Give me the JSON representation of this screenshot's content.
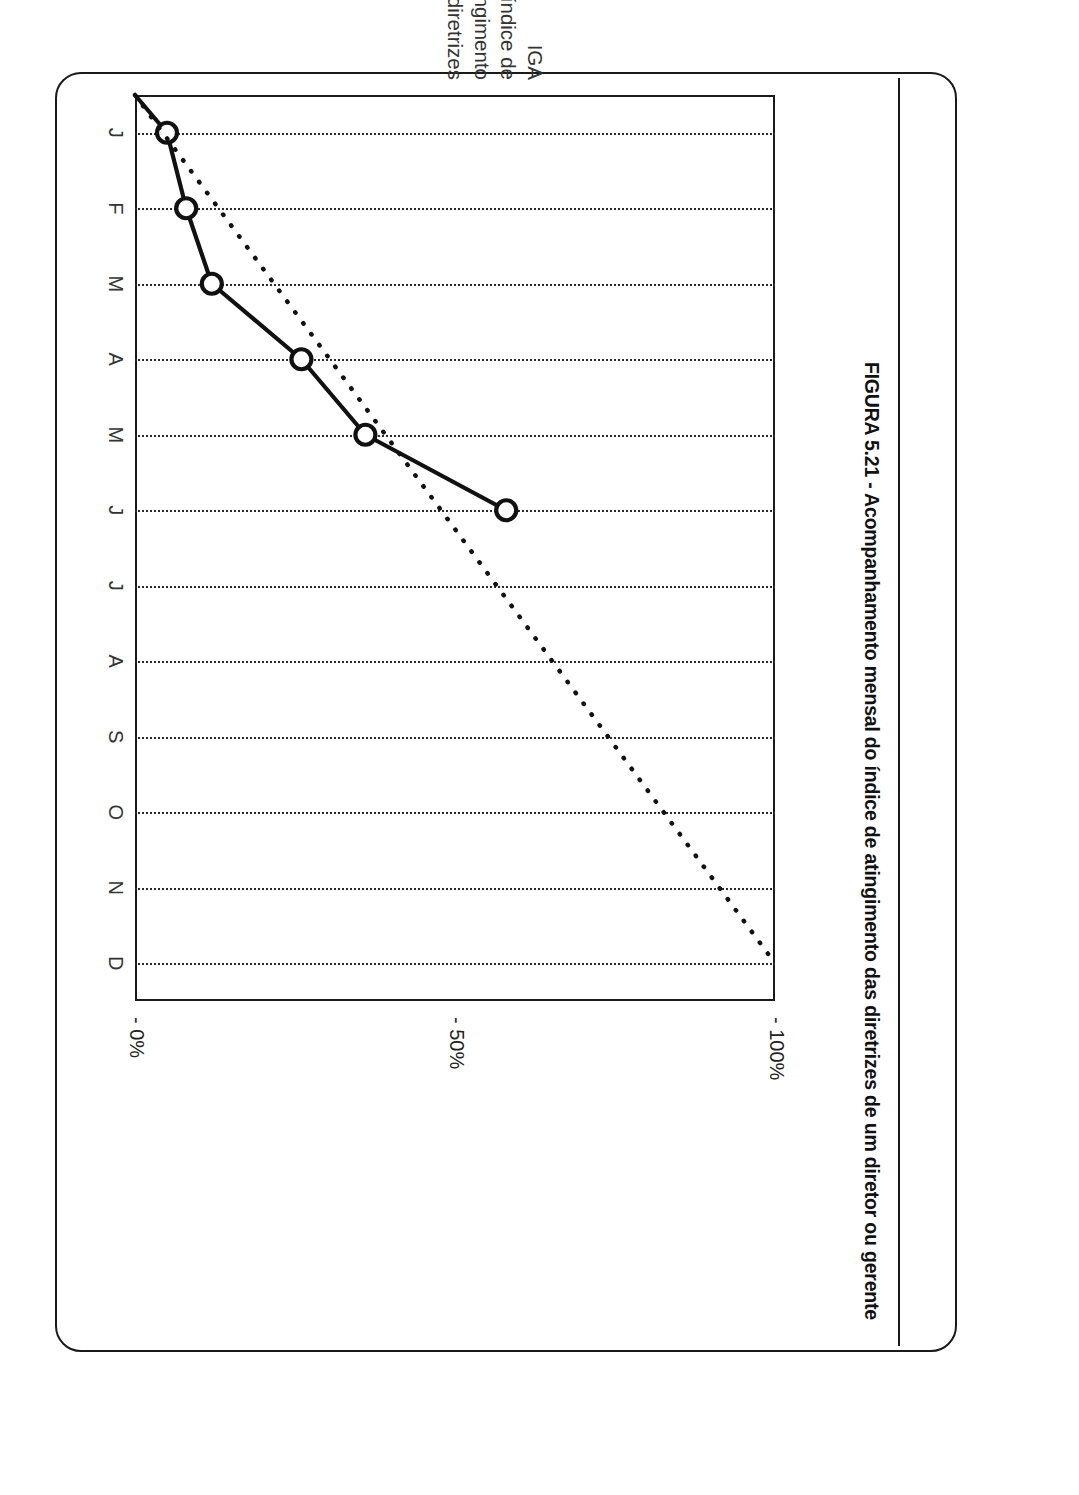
{
  "caption": "FIGURA 5.21 - Acompanhamento mensal do índice de atingimento das diretrizes de um diretor ou gerente",
  "axis_title": {
    "line1": "IGA",
    "line2": "índice de",
    "line3": "atingimento",
    "line4": "das diretrizes"
  },
  "colors": {
    "ink": "#1a1a1a",
    "grid": "#2a2a2a",
    "series": "#111111",
    "marker_fill": "#ffffff"
  },
  "chart_data": {
    "type": "line",
    "title": "",
    "xlabel": "",
    "ylabel": "IGA índice de atingimento das diretrizes",
    "categories": [
      "J",
      "F",
      "M",
      "A",
      "M",
      "J",
      "J",
      "A",
      "S",
      "O",
      "N",
      "D"
    ],
    "ylim": [
      0,
      100
    ],
    "ytick_labels": [
      "- 100%",
      "- 50%",
      "- 0%"
    ],
    "yticks": [
      100,
      50,
      0
    ],
    "grid": true,
    "grid_axis": "x",
    "legend": "none",
    "series": [
      {
        "name": "IGA realizado",
        "style": "solid-with-open-circle-markers",
        "x": [
          "J",
          "F",
          "M",
          "A",
          "M",
          "J"
        ],
        "values": [
          5,
          8,
          12,
          26,
          36,
          58
        ]
      },
      {
        "name": "Meta acumulada",
        "style": "dotted-reference-line",
        "x": [
          "origem",
          "D"
        ],
        "values": [
          0,
          100
        ]
      }
    ]
  }
}
